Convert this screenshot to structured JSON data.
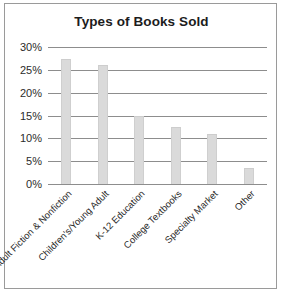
{
  "chart_data": {
    "type": "bar",
    "title": "Types of Books Sold",
    "xlabel": "",
    "ylabel": "",
    "categories": [
      "Adult Fiction & Nonfiction",
      "Children's/Young Adult",
      "K-12 Education",
      "College Textbooks",
      "Specialty Market",
      "Other"
    ],
    "values": [
      27.3,
      26.0,
      15.0,
      12.5,
      11.0,
      3.5
    ],
    "ylim": [
      0,
      30
    ],
    "ytick_labels": [
      "30%",
      "25%",
      "20%",
      "15%",
      "10%",
      "5%",
      "0%"
    ],
    "ytick_values": [
      30,
      25,
      20,
      15,
      10,
      5,
      0
    ],
    "grid": true,
    "legend": false,
    "bar_color": "#dadada",
    "gridline_color": "#8d8d8d",
    "text_color": "#2b2b2b",
    "border_color": "#9a9a9a"
  }
}
